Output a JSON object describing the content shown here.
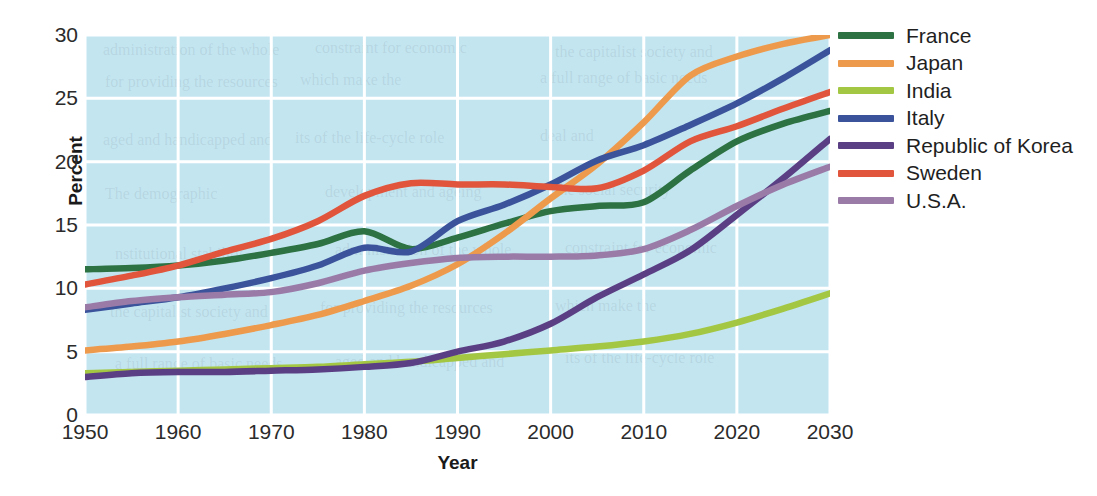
{
  "chart_data": {
    "type": "line",
    "title": "",
    "xlabel": "Year",
    "ylabel": "Percent",
    "xlim": [
      1950,
      2030
    ],
    "ylim": [
      0,
      30
    ],
    "xticks": [
      "1950",
      "1960",
      "1970",
      "1980",
      "1990",
      "2000",
      "2010",
      "2020",
      "2030"
    ],
    "yticks": [
      "0",
      "5",
      "10",
      "15",
      "20",
      "25",
      "30"
    ],
    "grid": true,
    "legend_position": "right",
    "plot_background": "#c3e5f0",
    "gridline_color": "#ffffff",
    "x": [
      1950,
      1955,
      1960,
      1965,
      1970,
      1975,
      1980,
      1985,
      1990,
      1995,
      2000,
      2005,
      2010,
      2015,
      2020,
      2025,
      2030
    ],
    "series": [
      {
        "name": "France",
        "color": "#2d7242",
        "values": [
          11.5,
          11.6,
          11.8,
          12.2,
          12.8,
          13.5,
          14.5,
          13.1,
          14.0,
          15.1,
          16.1,
          16.5,
          16.8,
          19.3,
          21.6,
          23.0,
          24.0
        ]
      },
      {
        "name": "Japan",
        "color": "#ee9a4c",
        "values": [
          5.1,
          5.4,
          5.8,
          6.4,
          7.1,
          7.9,
          9.0,
          10.2,
          11.9,
          14.3,
          17.1,
          19.8,
          23.1,
          26.8,
          28.3,
          29.3,
          30.0
        ]
      },
      {
        "name": "India",
        "color": "#a4c743",
        "values": [
          3.3,
          3.4,
          3.5,
          3.6,
          3.7,
          3.8,
          4.0,
          4.2,
          4.5,
          4.8,
          5.1,
          5.4,
          5.8,
          6.4,
          7.3,
          8.4,
          9.6
        ]
      },
      {
        "name": "Italy",
        "color": "#3a539b",
        "values": [
          8.3,
          8.8,
          9.3,
          10.0,
          10.8,
          11.8,
          13.2,
          12.9,
          15.3,
          16.6,
          18.2,
          20.1,
          21.3,
          22.9,
          24.6,
          26.6,
          28.8
        ]
      },
      {
        "name": "Republic of Korea",
        "color": "#5b3f84",
        "values": [
          3.0,
          3.3,
          3.4,
          3.4,
          3.5,
          3.6,
          3.8,
          4.1,
          5.0,
          5.8,
          7.2,
          9.3,
          11.1,
          13.0,
          15.8,
          18.7,
          21.8
        ]
      },
      {
        "name": "Sweden",
        "color": "#e0553c",
        "values": [
          10.3,
          11.0,
          11.8,
          12.9,
          13.9,
          15.3,
          17.3,
          18.3,
          18.2,
          18.2,
          18.0,
          17.9,
          19.3,
          21.6,
          22.8,
          24.2,
          25.5
        ]
      },
      {
        "name": "U.S.A.",
        "color": "#9a7ba8",
        "values": [
          8.5,
          9.0,
          9.3,
          9.5,
          9.7,
          10.4,
          11.4,
          12.0,
          12.4,
          12.5,
          12.5,
          12.6,
          13.1,
          14.6,
          16.5,
          18.2,
          19.6
        ]
      }
    ]
  },
  "background_text": [
    "administration of the whole",
    "constraint for economic",
    "the capitalist society and",
    "for providing the resources",
    "which make the",
    "a full range of basic needs",
    "aged and handicapped and",
    "its of the life-cycle role",
    "deal and",
    "The demographic",
    "development and ageing",
    "the social security",
    "nstitutional stability"
  ]
}
